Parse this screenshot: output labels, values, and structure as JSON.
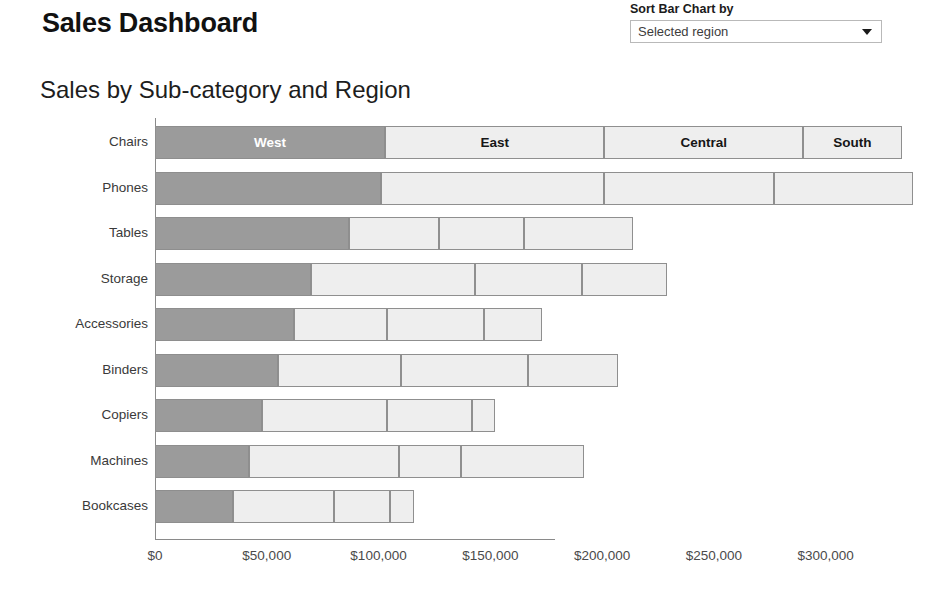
{
  "header": {
    "title": "Sales Dashboard"
  },
  "sort_control": {
    "label": "Sort Bar Chart by",
    "selected": "Selected region",
    "options": [
      "Selected region"
    ],
    "arrow_icon": "chevron-down-icon"
  },
  "chart_data": {
    "type": "bar",
    "subtype": "stacked-horizontal",
    "title": "Sales by Sub-category and Region",
    "xlabel": "",
    "ylabel": "",
    "xlim": [
      0,
      340000
    ],
    "grid": false,
    "legend_position": "in-bar-first-row",
    "axis_tick_labels": [
      "$0",
      "$50,000",
      "$100,000",
      "$150,000",
      "$200,000",
      "$250,000",
      "$300,000"
    ],
    "axis_tick_values": [
      0,
      50000,
      100000,
      150000,
      200000,
      250000,
      300000
    ],
    "categories": [
      "Chairs",
      "Phones",
      "Tables",
      "Storage",
      "Accessories",
      "Binders",
      "Copiers",
      "Machines",
      "Bookcases"
    ],
    "series": [
      {
        "name": "West",
        "style": "dark",
        "values": [
          103000,
          101000,
          87000,
          70000,
          62000,
          55000,
          48000,
          42000,
          35000
        ]
      },
      {
        "name": "East",
        "style": "light",
        "values": [
          98000,
          100000,
          40000,
          73000,
          42000,
          55000,
          56000,
          67000,
          45000
        ]
      },
      {
        "name": "Central",
        "style": "light",
        "values": [
          89000,
          76000,
          38000,
          48000,
          43000,
          57000,
          38000,
          28000,
          25000
        ]
      },
      {
        "name": "South",
        "style": "light",
        "values": [
          44000,
          62000,
          49000,
          38000,
          26000,
          40000,
          10000,
          55000,
          11000
        ]
      }
    ],
    "totals": [
      334000,
      339000,
      214000,
      229000,
      173000,
      207000,
      152000,
      192000,
      116000
    ],
    "segment_labels_shown_on": "Chairs"
  }
}
